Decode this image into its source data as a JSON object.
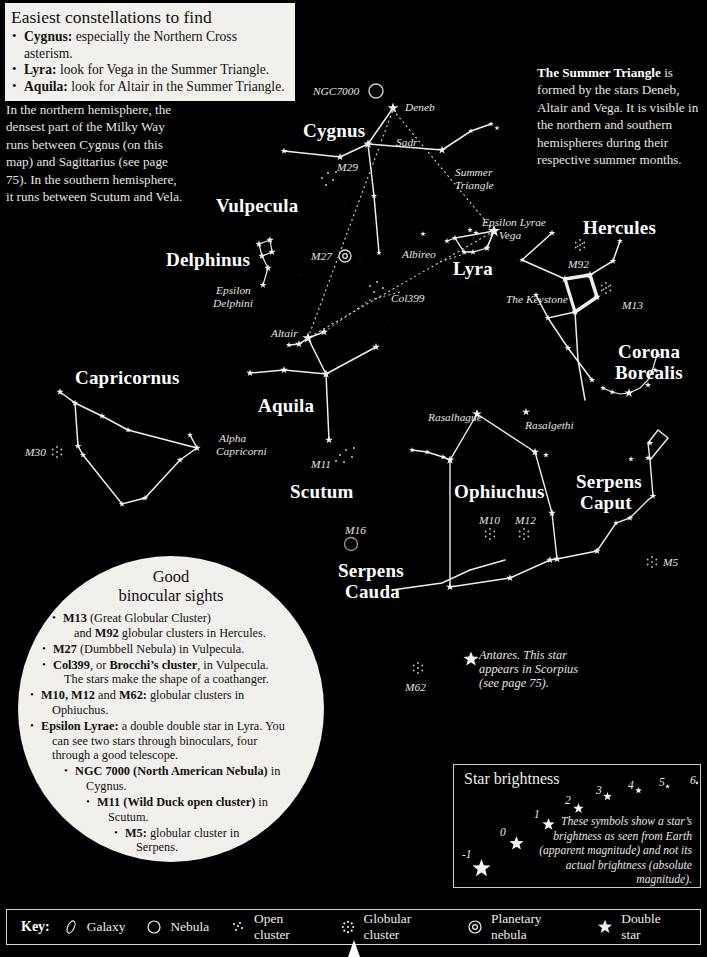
{
  "info_box": {
    "title": "Easiest constellations to find",
    "items": [
      {
        "bold": "Cygnus:",
        "rest": " especially the Northern Cross asterism."
      },
      {
        "bold": "Lyra:",
        "rest": " look for Vega in the Summer Triangle."
      },
      {
        "bold": "Aquila:",
        "rest": " look for Altair in the Summer Triangle."
      }
    ]
  },
  "milky_way_note": "In the northern hemisphere, the densest part of the Milky Way runs between Cygnus (on this map) and Sagittarius (see page 75). In the southern hemisphere, it runs between Scutum and Vela.",
  "summer_triangle_note": {
    "bold": "The Summer Triangle",
    "rest": " is formed by the stars Deneb, Altair and Vega. It is visible in the northern and southern hemispheres during their respective summer months."
  },
  "constellations": [
    {
      "name": "Cygnus",
      "x": 303,
      "y": 120
    },
    {
      "name": "Vulpecula",
      "x": 216,
      "y": 195
    },
    {
      "name": "Delphinus",
      "x": 166,
      "y": 249
    },
    {
      "name": "Capricornus",
      "x": 75,
      "y": 367
    },
    {
      "name": "Aquila",
      "x": 258,
      "y": 395
    },
    {
      "name": "Scutum",
      "x": 290,
      "y": 481
    },
    {
      "name": "Lyra",
      "x": 453,
      "y": 258
    },
    {
      "name": "Hercules",
      "x": 583,
      "y": 217
    },
    {
      "name": "Corona",
      "x": 618,
      "y": 341
    },
    {
      "name": "Borealis",
      "x": 615,
      "y": 362
    },
    {
      "name": "Ophiuchus",
      "x": 454,
      "y": 481
    },
    {
      "name": "Serpens",
      "x": 576,
      "y": 471
    },
    {
      "name": "Caput",
      "x": 580,
      "y": 492
    },
    {
      "name": "Serpens",
      "x": 338,
      "y": 560
    },
    {
      "name": "Cauda",
      "x": 345,
      "y": 581
    }
  ],
  "star_labels": [
    {
      "text": "NGC7000",
      "x": 313,
      "y": 85,
      "size": "sm"
    },
    {
      "text": "Deneb",
      "x": 405,
      "y": 101,
      "size": "sm"
    },
    {
      "text": "Sadr",
      "x": 396,
      "y": 136,
      "size": "sm"
    },
    {
      "text": "M29",
      "x": 337,
      "y": 161,
      "size": "sm"
    },
    {
      "text": "Summer",
      "x": 455,
      "y": 166,
      "size": "sm"
    },
    {
      "text": "Triangle",
      "x": 455,
      "y": 179,
      "size": "sm"
    },
    {
      "text": "Epsilon Lyrae",
      "x": 482,
      "y": 216,
      "size": "sm"
    },
    {
      "text": "Vega",
      "x": 499,
      "y": 229,
      "size": "sm"
    },
    {
      "text": "M92",
      "x": 568,
      "y": 258,
      "size": "sm"
    },
    {
      "text": "The Keystone",
      "x": 506,
      "y": 293,
      "size": "sm"
    },
    {
      "text": "M13",
      "x": 622,
      "y": 299,
      "size": "sm"
    },
    {
      "text": "Albireo",
      "x": 402,
      "y": 248,
      "size": "sm"
    },
    {
      "text": "M27",
      "x": 311,
      "y": 250,
      "size": "sm"
    },
    {
      "text": "Epsilon",
      "x": 216,
      "y": 284,
      "size": "sm"
    },
    {
      "text": "Delphini",
      "x": 213,
      "y": 297,
      "size": "sm"
    },
    {
      "text": "Col399",
      "x": 391,
      "y": 292,
      "size": "sm"
    },
    {
      "text": "Altair",
      "x": 271,
      "y": 327,
      "size": "sm"
    },
    {
      "text": "M30",
      "x": 25,
      "y": 446,
      "size": "sm"
    },
    {
      "text": "Alpha",
      "x": 219,
      "y": 432,
      "size": "sm"
    },
    {
      "text": "Capricorni",
      "x": 216,
      "y": 445,
      "size": "sm"
    },
    {
      "text": "M11",
      "x": 311,
      "y": 458,
      "size": "sm"
    },
    {
      "text": "Rasalhague",
      "x": 428,
      "y": 411,
      "size": "sm"
    },
    {
      "text": "Rasalgethi",
      "x": 525,
      "y": 419,
      "size": "sm"
    },
    {
      "text": "M10",
      "x": 479,
      "y": 514,
      "size": "sm"
    },
    {
      "text": "M12",
      "x": 515,
      "y": 514,
      "size": "sm"
    },
    {
      "text": "M5",
      "x": 663,
      "y": 556,
      "size": "sm"
    },
    {
      "text": "M16",
      "x": 345,
      "y": 524,
      "size": "sm"
    },
    {
      "text": "M62",
      "x": 405,
      "y": 681,
      "size": "sm"
    }
  ],
  "antares_note": {
    "lines": [
      "Antares. This star",
      "appears in Scorpius",
      "(see page 75)."
    ]
  },
  "binocular_circle": {
    "title_line1": "Good",
    "title_line2": "binocular sights",
    "items": [
      {
        "indent": "i1",
        "html": "<b>M13</b> (Great Globular Cluster)",
        "cont": "and <b>M92</b> globular clusters in Hercules."
      },
      {
        "indent": "i2",
        "html": "<b>M27</b> (Dumbbell Nebula) in Vulpecula.",
        "cont": ""
      },
      {
        "indent": "i2",
        "html": "<b>Col399</b>, or <b>Brocchi’s cluster</b>, in Vulpecula.",
        "cont": "The stars make the shape of a coathanger."
      },
      {
        "indent": "i3",
        "html": "<b>M10, M12</b> and <b>M62:</b> globular clusters in",
        "cont": "Ophiuchus."
      },
      {
        "indent": "i3",
        "html": "<b>Epsilon Lyrae:</b> a double double star in Lyra. You",
        "cont": "can see two stars through binoculars, four<br>through a good telescope."
      },
      {
        "indent": "i4",
        "html": "<b>NGC 7000 (North American Nebula)</b> in",
        "cont": "Cygnus."
      },
      {
        "indent": "i5",
        "html": "<b>M11 (Wild Duck open cluster)</b> in",
        "cont": "Scutum."
      },
      {
        "indent": "i6",
        "html": "<b>M5:</b> globular cluster in",
        "cont": "Serpens."
      }
    ]
  },
  "brightness_box": {
    "title": "Star brightness",
    "note": "These symbols show a star’s brightness as seen from Earth (apparent magnitude) and not its actual brightness (absolute magnitude).",
    "magnitudes": [
      {
        "label": "-1",
        "lx": 462,
        "ly": 848,
        "sx": 470,
        "sy": 857,
        "size": 19
      },
      {
        "label": "0",
        "lx": 500,
        "ly": 826,
        "sx": 507,
        "sy": 834,
        "size": 15
      },
      {
        "label": "1",
        "lx": 534,
        "ly": 808,
        "sx": 540,
        "sy": 816,
        "size": 13
      },
      {
        "label": "2",
        "lx": 565,
        "ly": 794,
        "sx": 571,
        "sy": 801,
        "size": 11
      },
      {
        "label": "3",
        "lx": 596,
        "ly": 784,
        "sx": 601,
        "sy": 790,
        "size": 9
      },
      {
        "label": "4",
        "lx": 628,
        "ly": 779,
        "sx": 633,
        "sy": 785,
        "size": 7
      },
      {
        "label": "5",
        "lx": 659,
        "ly": 776,
        "sx": 663,
        "sy": 782,
        "size": 5
      },
      {
        "label": "6",
        "lx": 690,
        "ly": 774,
        "sx": 693,
        "sy": 779,
        "size": 4
      }
    ]
  },
  "key": {
    "label": "Key:",
    "items": [
      {
        "icon": "galaxy-icon",
        "text": "Galaxy"
      },
      {
        "icon": "nebula-icon",
        "text": "Nebula"
      },
      {
        "icon": "open-cluster-icon",
        "text": "Open cluster"
      },
      {
        "icon": "globular-cluster-icon",
        "text": "Globular cluster"
      },
      {
        "icon": "planetary-nebula-icon",
        "text": "Planetary nebula"
      },
      {
        "icon": "double-star-icon",
        "text": "Double star"
      }
    ]
  },
  "chart_data": {
    "type": "scatter",
    "stars": [
      {
        "x": 393,
        "y": 108,
        "m": 1.3
      },
      {
        "x": 368,
        "y": 144,
        "m": 2.2
      },
      {
        "x": 284,
        "y": 151,
        "m": 4.0
      },
      {
        "x": 340,
        "y": 157,
        "m": 3.2
      },
      {
        "x": 442,
        "y": 150,
        "m": 3.0
      },
      {
        "x": 471,
        "y": 131,
        "m": 5.0
      },
      {
        "x": 491,
        "y": 124,
        "m": 5.0
      },
      {
        "x": 497,
        "y": 128,
        "m": 5.2
      },
      {
        "x": 374,
        "y": 196,
        "m": 4.5
      },
      {
        "x": 379,
        "y": 253,
        "m": 5.0
      },
      {
        "x": 423,
        "y": 234,
        "m": 5.0
      },
      {
        "x": 494,
        "y": 231,
        "m": 0.0
      },
      {
        "x": 476,
        "y": 233,
        "m": 4.8
      },
      {
        "x": 470,
        "y": 230,
        "m": 4.8
      },
      {
        "x": 455,
        "y": 238,
        "m": 4.2
      },
      {
        "x": 447,
        "y": 241,
        "m": 4.6
      },
      {
        "x": 464,
        "y": 252,
        "m": 4.5
      },
      {
        "x": 473,
        "y": 252,
        "m": 4.2
      },
      {
        "x": 487,
        "y": 248,
        "m": 3.8
      },
      {
        "x": 552,
        "y": 233,
        "m": 4.0
      },
      {
        "x": 522,
        "y": 260,
        "m": 5.0
      },
      {
        "x": 565,
        "y": 279,
        "m": 3.4
      },
      {
        "x": 590,
        "y": 275,
        "m": 3.0
      },
      {
        "x": 597,
        "y": 297,
        "m": 3.4
      },
      {
        "x": 575,
        "y": 312,
        "m": 3.6
      },
      {
        "x": 620,
        "y": 241,
        "m": 4.6
      },
      {
        "x": 613,
        "y": 261,
        "m": 4.2
      },
      {
        "x": 536,
        "y": 295,
        "m": 4.4
      },
      {
        "x": 548,
        "y": 318,
        "m": 4.0
      },
      {
        "x": 568,
        "y": 348,
        "m": 4.0
      },
      {
        "x": 592,
        "y": 380,
        "m": 4.2
      },
      {
        "x": 658,
        "y": 355,
        "m": 4.4
      },
      {
        "x": 655,
        "y": 370,
        "m": 4.6
      },
      {
        "x": 648,
        "y": 385,
        "m": 4.4
      },
      {
        "x": 629,
        "y": 393,
        "m": 2.2
      },
      {
        "x": 612,
        "y": 392,
        "m": 4.8
      },
      {
        "x": 603,
        "y": 388,
        "m": 4.8
      },
      {
        "x": 308,
        "y": 338,
        "m": 0.8
      },
      {
        "x": 299,
        "y": 344,
        "m": 3.4
      },
      {
        "x": 289,
        "y": 345,
        "m": 4.4
      },
      {
        "x": 324,
        "y": 332,
        "m": 3.2
      },
      {
        "x": 326,
        "y": 374,
        "m": 2.7
      },
      {
        "x": 284,
        "y": 370,
        "m": 3.4
      },
      {
        "x": 250,
        "y": 373,
        "m": 3.6
      },
      {
        "x": 376,
        "y": 347,
        "m": 3.2
      },
      {
        "x": 329,
        "y": 440,
        "m": 3.4
      },
      {
        "x": 60,
        "y": 392,
        "m": 3.8
      },
      {
        "x": 75,
        "y": 403,
        "m": 4.0
      },
      {
        "x": 102,
        "y": 416,
        "m": 4.2
      },
      {
        "x": 128,
        "y": 430,
        "m": 4.4
      },
      {
        "x": 197,
        "y": 448,
        "m": 3.6
      },
      {
        "x": 180,
        "y": 460,
        "m": 4.2
      },
      {
        "x": 78,
        "y": 446,
        "m": 4.0
      },
      {
        "x": 83,
        "y": 455,
        "m": 4.4
      },
      {
        "x": 122,
        "y": 504,
        "m": 4.2
      },
      {
        "x": 145,
        "y": 498,
        "m": 4.4
      },
      {
        "x": 190,
        "y": 435,
        "m": 4.6
      },
      {
        "x": 477,
        "y": 414,
        "m": 2.1
      },
      {
        "x": 526,
        "y": 412,
        "m": 3.2
      },
      {
        "x": 535,
        "y": 452,
        "m": 3.0
      },
      {
        "x": 546,
        "y": 455,
        "m": 4.6
      },
      {
        "x": 450,
        "y": 460,
        "m": 2.7
      },
      {
        "x": 443,
        "y": 457,
        "m": 4.6
      },
      {
        "x": 427,
        "y": 452,
        "m": 4.8
      },
      {
        "x": 412,
        "y": 450,
        "m": 4.8
      },
      {
        "x": 552,
        "y": 513,
        "m": 3.4
      },
      {
        "x": 557,
        "y": 559,
        "m": 3.2
      },
      {
        "x": 550,
        "y": 560,
        "m": 3.6
      },
      {
        "x": 450,
        "y": 587,
        "m": 3.2
      },
      {
        "x": 510,
        "y": 578,
        "m": 3.6
      },
      {
        "x": 650,
        "y": 443,
        "m": 4.2
      },
      {
        "x": 648,
        "y": 458,
        "m": 4.4
      },
      {
        "x": 653,
        "y": 496,
        "m": 4.0
      },
      {
        "x": 630,
        "y": 518,
        "m": 4.2
      },
      {
        "x": 616,
        "y": 523,
        "m": 4.8
      },
      {
        "x": 597,
        "y": 551,
        "m": 3.6
      },
      {
        "x": 631,
        "y": 459,
        "m": 4.8
      }
    ],
    "note": "Positions are approximate screen coordinates of plotted stars; magnitudes drive symbol size."
  }
}
